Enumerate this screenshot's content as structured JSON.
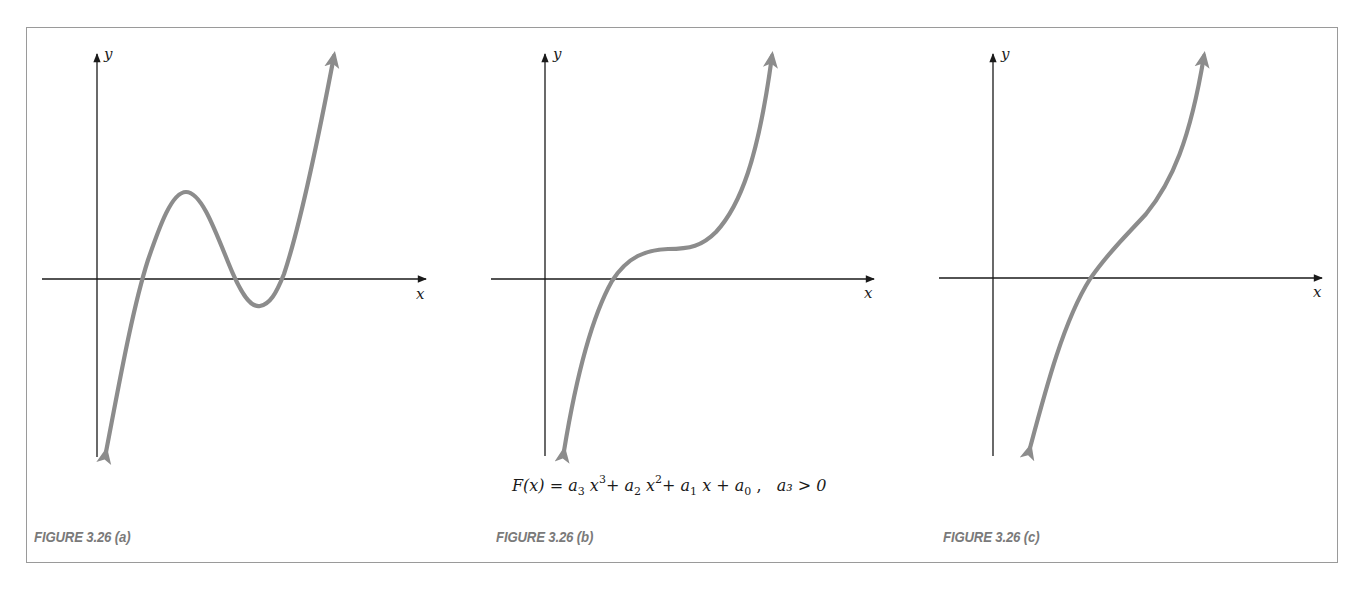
{
  "figure": {
    "formula": {
      "lhs": "F(x)",
      "equals": "=",
      "terms": [
        {
          "coef": "a",
          "sub": "3",
          "var": "x",
          "pow": "3"
        },
        {
          "coef": "a",
          "sub": "2",
          "var": "x",
          "pow": "2"
        },
        {
          "coef": "a",
          "sub": "1",
          "var": "x",
          "pow": ""
        },
        {
          "coef": "a",
          "sub": "0",
          "var": "",
          "pow": ""
        }
      ],
      "condition": "a₃ > 0",
      "text": "F(x) = a3 x^3 + a2 x^2 + a1 x + a0 ,  a3 > 0"
    },
    "panels": [
      {
        "id": "a",
        "caption": "FIGURE 3.26 (a)",
        "x_label": "x",
        "y_label": "y",
        "description": "Cubic with local max and local min; three real roots"
      },
      {
        "id": "b",
        "caption": "FIGURE 3.26 (b)",
        "x_label": "x",
        "y_label": "y",
        "description": "Cubic with horizontal inflection plateau; one real root"
      },
      {
        "id": "c",
        "caption": "FIGURE 3.26 (c)",
        "x_label": "x",
        "y_label": "y",
        "description": "Monotonic increasing cubic; one real root"
      }
    ],
    "colors": {
      "curve": "#8c8c8c",
      "axis": "#1a1a1a",
      "caption": "#7a7a7a",
      "frame": "#9a9a9a"
    }
  }
}
